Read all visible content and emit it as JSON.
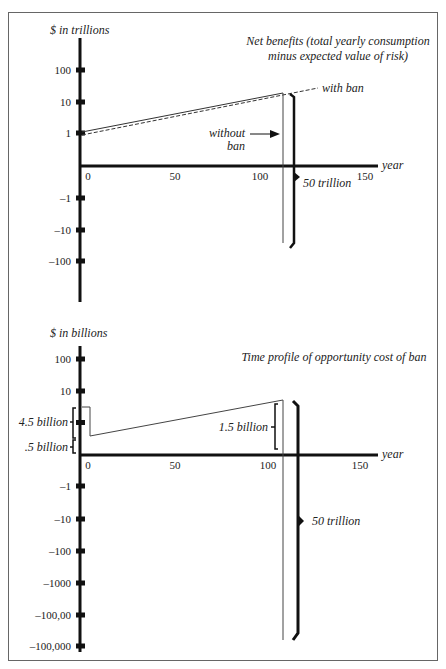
{
  "chart_data": [
    {
      "type": "line",
      "title": "Net benefits (total yearly consumption minus expected value of risk)",
      "title_lines": [
        "Net benefits (total yearly consumption",
        "minus expected value of risk)"
      ],
      "ylabel": "$ in trillions",
      "xlabel": "year",
      "yscale": "log (symmetric)",
      "y_ticks": [
        "100",
        "10",
        "1",
        "-1",
        "-10",
        "-100"
      ],
      "x_ticks": [
        "0",
        "50",
        "100",
        "150"
      ],
      "xlim": [
        0,
        160
      ],
      "series": [
        {
          "name": "without ban",
          "style": "solid",
          "x": [
            0,
            108
          ],
          "y": [
            1.1,
            20
          ],
          "drop_at_x": 108,
          "drop_to": -50
        },
        {
          "name": "with ban",
          "style": "dashed",
          "x": [
            0,
            108,
            130
          ],
          "y": [
            1.0,
            18,
            25
          ]
        }
      ],
      "annotations": [
        {
          "text": "with ban",
          "points_to": "dashed line"
        },
        {
          "text": "without ban",
          "points_to": "vertical drop at ~year 108",
          "arrow": true
        },
        {
          "text": "50 trillion",
          "bracket": "vertical gap between lines at ~year 112"
        }
      ],
      "grid": false,
      "legend": "inline annotations"
    },
    {
      "type": "line",
      "title": "Time profile of opportunity cost of ban",
      "ylabel": "$ in billions",
      "xlabel": "year",
      "yscale": "log (symmetric)",
      "y_ticks": [
        "100",
        "10",
        "4.5 billion",
        ".5 billion",
        "-1",
        "-10",
        "-100",
        "-1000",
        "-100,00",
        "-100,000"
      ],
      "y_tick_marks": [
        "100",
        "10",
        "-1",
        "-10",
        "-100",
        "-1000",
        "-100,00",
        "-100,000"
      ],
      "x_ticks": [
        "0",
        "50",
        "100",
        "150"
      ],
      "xlim": [
        0,
        160
      ],
      "series": [
        {
          "name": "opportunity cost",
          "style": "solid",
          "x": [
            0,
            5,
            5,
            108,
            108
          ],
          "y": [
            4.5,
            4.5,
            0.5,
            1.5,
            -50000
          ]
        }
      ],
      "annotations": [
        {
          "text": "4.5 billion",
          "bracket": "initial step height"
        },
        {
          "text": ".5 billion",
          "bracket": "level after drop"
        },
        {
          "text": "1.5 billion",
          "bracket": "rise by ~year 108"
        },
        {
          "text": "50 trillion",
          "bracket": "negative cost at ~year 112"
        }
      ],
      "grid": false
    }
  ],
  "upper": {
    "ylabel": "$ in trillions",
    "title_line1": "Net benefits (total yearly consumption",
    "title_line2": "minus expected value of risk)",
    "yticks": [
      {
        "label": "100",
        "y": 70
      },
      {
        "label": "10",
        "y": 102
      },
      {
        "label": "1",
        "y": 133
      },
      {
        "label": "-1",
        "y": 198
      },
      {
        "label": "-10",
        "y": 230
      },
      {
        "label": "-100",
        "y": 261
      }
    ],
    "xticks": [
      {
        "label": "0",
        "x": 88
      },
      {
        "label": "50",
        "x": 175
      },
      {
        "label": "100",
        "x": 260
      },
      {
        "label": "150",
        "x": 365
      }
    ],
    "xlabel": "year",
    "with_ban_label": "with ban",
    "without_ban_line1": "without",
    "without_ban_line2": "ban",
    "bracket_label": "50 trillion"
  },
  "lower": {
    "ylabel": "$ in billions",
    "title": "Time profile of opportunity cost of ban",
    "yticks": [
      {
        "label": "100",
        "y": 359
      },
      {
        "label": "10",
        "y": 391
      },
      {
        "label": "-1",
        "y": 486
      },
      {
        "label": "-10",
        "y": 519
      },
      {
        "label": "-100",
        "y": 551
      },
      {
        "label": "-1000",
        "y": 583
      },
      {
        "label": "-100,00",
        "y": 615
      },
      {
        "label": "-100,000",
        "y": 646
      }
    ],
    "xticks": [
      {
        "label": "0",
        "x": 88
      },
      {
        "label": "50",
        "x": 175
      },
      {
        "label": "100",
        "x": 268
      },
      {
        "label": "150",
        "x": 360
      }
    ],
    "xlabel": "year",
    "brace_45": "4.5 billion",
    "brace_05": ".5 billion",
    "brace_15": "1.5 billion",
    "bracket_label": "50 trillion"
  },
  "colors": {
    "ink": "#1a1a1a",
    "thin": "#555555",
    "border": "#666666",
    "background": "#ffffff"
  }
}
